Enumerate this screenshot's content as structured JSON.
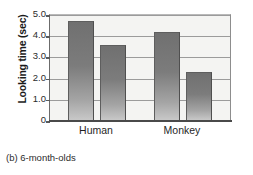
{
  "chart_data": {
    "type": "bar",
    "title": "",
    "caption": "(b) 6-month-olds",
    "xlabel": "",
    "ylabel": "Looking time (sec)",
    "ylim": [
      0,
      5.0
    ],
    "yticks": [
      "0",
      "1.0",
      "2.0",
      "3.0",
      "4.0",
      "5.0"
    ],
    "ytick_values": [
      0,
      1.0,
      2.0,
      3.0,
      4.0,
      5.0
    ],
    "grid": true,
    "legend": "none",
    "categories": [
      "Human",
      "Monkey"
    ],
    "series": [
      {
        "name": "bar-1",
        "values": [
          4.65,
          4.15
        ]
      },
      {
        "name": "bar-2",
        "values": [
          3.55,
          2.25
        ]
      }
    ],
    "bars": [
      {
        "group": "Human",
        "index": 0,
        "value": 4.65
      },
      {
        "group": "Human",
        "index": 1,
        "value": 3.55
      },
      {
        "group": "Monkey",
        "index": 0,
        "value": 4.15
      },
      {
        "group": "Monkey",
        "index": 1,
        "value": 2.25
      }
    ],
    "colors": {
      "bar_top": "#707070",
      "bar_bottom": "#c8c8c8",
      "plot_background": "#f4f4f2",
      "gridline": "#9b9b9b",
      "axis": "#4a4a4a",
      "text": "#1a1a1a"
    }
  }
}
